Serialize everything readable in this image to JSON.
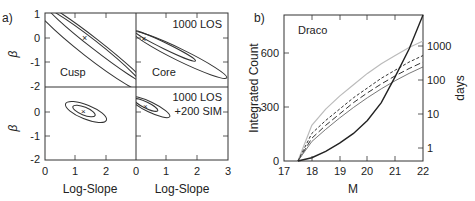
{
  "chart_data": [
    {
      "panel_label": "a)",
      "type": "contour",
      "subpanels": [
        {
          "label": "Cusp",
          "annotation": "",
          "xlabel": "",
          "ylabel": "β"
        },
        {
          "label": "Core",
          "annotation": "1000 LOS",
          "xlabel": "",
          "ylabel": ""
        },
        {
          "label": "",
          "annotation_line1": "",
          "xlabel": "Log-Slope",
          "ylabel": "β"
        },
        {
          "label": "",
          "annotation_line1": "1000 LOS",
          "annotation_line2": "+200 SIM",
          "xlabel": "Log-Slope",
          "ylabel": ""
        }
      ],
      "xlabel": "Log-Slope",
      "ylabel": "β",
      "xlim": [
        0,
        3
      ],
      "ylim": [
        -2,
        1
      ],
      "xticks_left": [
        "0",
        "1",
        "2"
      ],
      "xticks_right": [
        "0",
        "1",
        "2",
        "3"
      ],
      "yticks": [
        "1",
        "0",
        "-1",
        "-2"
      ]
    },
    {
      "panel_label": "b)",
      "type": "line",
      "title": "Draco",
      "xlabel": "M",
      "ylabel": "Integrated Count",
      "ylabel_right": "days",
      "xlim": [
        17,
        22
      ],
      "ylim": [
        0,
        900
      ],
      "xticks": [
        "17",
        "18",
        "19",
        "20",
        "21",
        "22"
      ],
      "yticks": [
        "0",
        "300",
        "600"
      ],
      "yticks_right": [
        "1",
        "10",
        "100",
        "1000"
      ],
      "x": [
        17.5,
        18,
        18.5,
        19,
        19.5,
        20,
        20.5,
        21,
        21.5,
        22
      ],
      "series": [
        {
          "name": "upper (light gray)",
          "style": "solid-light",
          "values": [
            0,
            220,
            320,
            400,
            470,
            540,
            600,
            650,
            700,
            740
          ]
        },
        {
          "name": "short dashed",
          "style": "short-dash",
          "values": [
            0,
            170,
            250,
            320,
            390,
            450,
            510,
            560,
            610,
            650
          ]
        },
        {
          "name": "long dashed",
          "style": "long-dash",
          "values": [
            0,
            140,
            220,
            290,
            360,
            420,
            475,
            525,
            570,
            610
          ]
        },
        {
          "name": "lower (thin)",
          "style": "solid-thin",
          "values": [
            0,
            120,
            195,
            265,
            330,
            390,
            445,
            495,
            540,
            580
          ]
        },
        {
          "name": "days (right axis)",
          "style": "solid-thick",
          "values": [
            0,
            20,
            60,
            110,
            170,
            250,
            360,
            520,
            690,
            900
          ]
        }
      ]
    }
  ]
}
